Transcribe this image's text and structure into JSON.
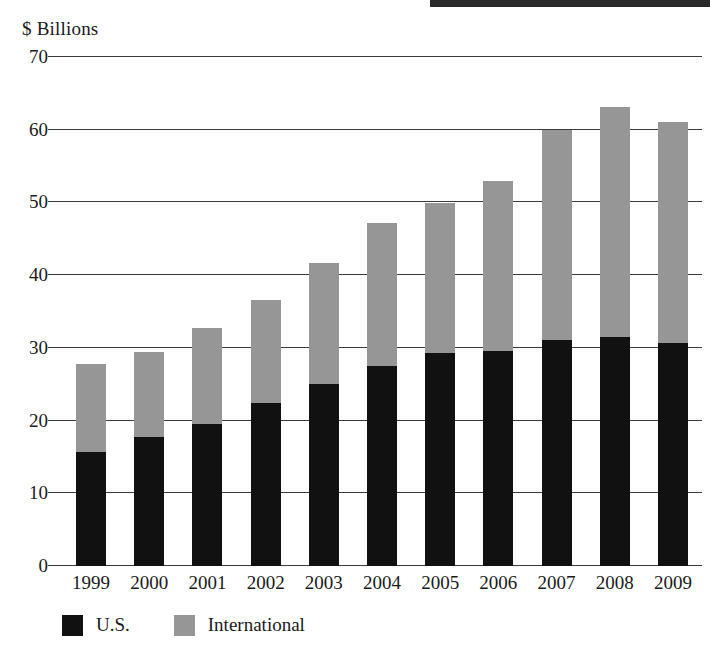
{
  "chart_data": {
    "type": "bar",
    "subtype": "stacked-vertical",
    "title": "",
    "axis_unit_label": "$ Billions",
    "xlabel": "",
    "ylabel": "$ Billions",
    "ylim": [
      0,
      70
    ],
    "y_ticks": [
      0,
      10,
      20,
      30,
      40,
      50,
      60,
      70
    ],
    "y_tick_labels": [
      "0",
      "10",
      "20",
      "30",
      "40",
      "50",
      "60",
      "70"
    ],
    "grid": "horizontal",
    "legend_position": "bottom-left",
    "categories": [
      "1999",
      "2000",
      "2001",
      "2002",
      "2003",
      "2004",
      "2005",
      "2006",
      "2007",
      "2008",
      "2009"
    ],
    "series": [
      {
        "name": "U.S.",
        "color": "#111111",
        "values": [
          15.7,
          17.7,
          19.5,
          22.4,
          25.0,
          27.5,
          29.3,
          29.6,
          31.1,
          31.5,
          30.7
        ]
      },
      {
        "name": "International",
        "color": "#969696",
        "values": [
          12.1,
          11.7,
          13.2,
          14.2,
          16.7,
          19.7,
          20.6,
          23.3,
          28.9,
          31.6,
          30.3
        ]
      }
    ],
    "totals": [
      27.8,
      29.4,
      32.7,
      36.6,
      41.7,
      47.2,
      49.9,
      52.9,
      60.0,
      63.1,
      61.0
    ]
  },
  "legend": {
    "items": [
      {
        "label": "U.S.",
        "swatch": "black-square-swatch"
      },
      {
        "label": "International",
        "swatch": "gray-square-swatch"
      }
    ]
  },
  "caption": {
    "fragment": ""
  }
}
